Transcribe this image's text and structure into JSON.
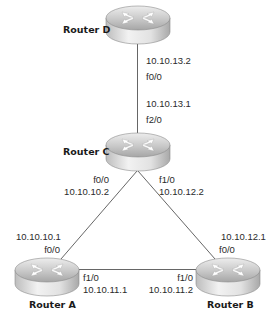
{
  "diagram": {
    "type": "network-topology",
    "colors": {
      "link": "#555555",
      "text": "#2b2b2b",
      "router_top_light": "#e6e6e6",
      "router_top_dark": "#a9a9a9",
      "router_side_light": "#f0f0f0",
      "router_side_dark": "#b8b8b8",
      "router_arrows": "#ffffff"
    },
    "routers": [
      {
        "id": "D",
        "name": "Router D"
      },
      {
        "id": "C",
        "name": "Router C"
      },
      {
        "id": "A",
        "name": "Router A"
      },
      {
        "id": "B",
        "name": "Router B"
      }
    ],
    "links": [
      {
        "from": "D",
        "to": "C",
        "d_side": {
          "ip": "10.10.13.2",
          "interface": "f0/0"
        },
        "c_side": {
          "ip": "10.10.13.1",
          "interface": "f2/0"
        }
      },
      {
        "from": "C",
        "to": "A",
        "c_side": {
          "interface": "f0/0",
          "ip": "10.10.10.2"
        },
        "a_side": {
          "ip": "10.10.10.1",
          "interface": "f0/0"
        }
      },
      {
        "from": "C",
        "to": "B",
        "c_side": {
          "interface": "f1/0",
          "ip": "10.10.12.2"
        },
        "b_side": {
          "ip": "10.10.12.1",
          "interface": "f0/0"
        }
      },
      {
        "from": "A",
        "to": "B",
        "a_side": {
          "interface": "f1/0",
          "ip": "10.10.11.1"
        },
        "b_side": {
          "interface": "f1/0",
          "ip": "10.10.11.2"
        }
      }
    ]
  }
}
